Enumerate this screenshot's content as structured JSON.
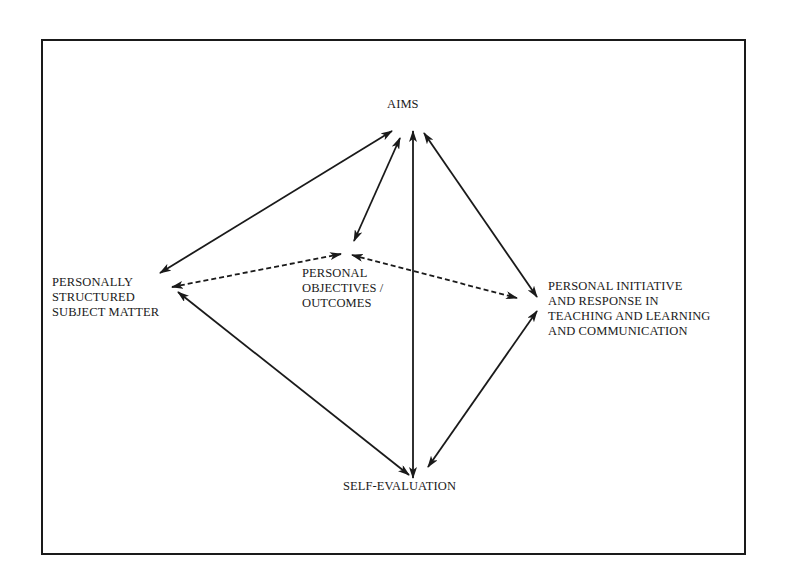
{
  "diagram": {
    "nodes": [
      {
        "id": "aims",
        "lines": [
          "AIMS"
        ]
      },
      {
        "id": "subject",
        "lines": [
          "PERSONALLY",
          "STRUCTURED",
          "SUBJECT MATTER"
        ]
      },
      {
        "id": "objectives",
        "lines": [
          "PERSONAL",
          "OBJECTIVES /",
          "OUTCOMES"
        ]
      },
      {
        "id": "initiative",
        "lines": [
          "PERSONAL INITIATIVE",
          "AND RESPONSE IN",
          "TEACHING AND LEARNING",
          "AND COMMUNICATION"
        ]
      },
      {
        "id": "self_eval",
        "lines": [
          "SELF-EVALUATION"
        ]
      }
    ],
    "edges": [
      {
        "from": "aims",
        "to": "subject",
        "style": "solid",
        "direction": "both"
      },
      {
        "from": "aims",
        "to": "objectives",
        "style": "solid",
        "direction": "both"
      },
      {
        "from": "aims",
        "to": "self_eval",
        "style": "solid",
        "direction": "both"
      },
      {
        "from": "aims",
        "to": "initiative",
        "style": "solid",
        "direction": "both"
      },
      {
        "from": "subject",
        "to": "self_eval",
        "style": "solid",
        "direction": "both"
      },
      {
        "from": "initiative",
        "to": "self_eval",
        "style": "solid",
        "direction": "both"
      },
      {
        "from": "subject",
        "to": "objectives",
        "style": "dashed",
        "direction": "both"
      },
      {
        "from": "objectives",
        "to": "initiative",
        "style": "dashed",
        "direction": "both"
      }
    ],
    "colors": {
      "ink": "#1a1a1a",
      "background": "#ffffff"
    }
  }
}
